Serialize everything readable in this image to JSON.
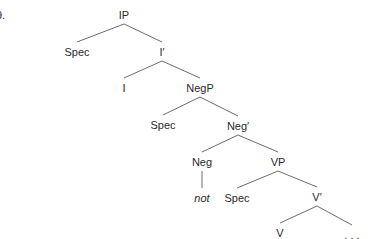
{
  "example_number": "9.",
  "tree": {
    "nodes": [
      {
        "id": "IP",
        "label": "IP",
        "x": 124,
        "y": 15
      },
      {
        "id": "Spec1",
        "label": "Spec",
        "x": 77,
        "y": 52
      },
      {
        "id": "Ibar",
        "label": "I′",
        "x": 162,
        "y": 52
      },
      {
        "id": "I",
        "label": "I",
        "x": 124,
        "y": 88
      },
      {
        "id": "NegP",
        "label": "NegP",
        "x": 200,
        "y": 88
      },
      {
        "id": "Spec2",
        "label": "Spec",
        "x": 163,
        "y": 125
      },
      {
        "id": "Negbar",
        "label": "Neg′",
        "x": 238,
        "y": 126
      },
      {
        "id": "Neg",
        "label": "Neg",
        "x": 202,
        "y": 162
      },
      {
        "id": "VP",
        "label": "VP",
        "x": 278,
        "y": 162
      },
      {
        "id": "not",
        "label": "not",
        "x": 202,
        "y": 198,
        "italic": true
      },
      {
        "id": "Spec3",
        "label": "Spec",
        "x": 237,
        "y": 198
      },
      {
        "id": "Vbar",
        "label": "V′",
        "x": 317,
        "y": 197
      },
      {
        "id": "V",
        "label": "V",
        "x": 280,
        "y": 233
      },
      {
        "id": "ellipsis",
        "label": ". . .",
        "x": 352,
        "y": 235
      }
    ],
    "edges": [
      [
        "IP",
        "Spec1"
      ],
      [
        "IP",
        "Ibar"
      ],
      [
        "Ibar",
        "I"
      ],
      [
        "Ibar",
        "NegP"
      ],
      [
        "NegP",
        "Spec2"
      ],
      [
        "NegP",
        "Negbar"
      ],
      [
        "Negbar",
        "Neg"
      ],
      [
        "Negbar",
        "VP"
      ],
      [
        "Neg",
        "not"
      ],
      [
        "VP",
        "Spec3"
      ],
      [
        "VP",
        "Vbar"
      ],
      [
        "Vbar",
        "V"
      ],
      [
        "Vbar",
        "ellipsis"
      ]
    ]
  }
}
